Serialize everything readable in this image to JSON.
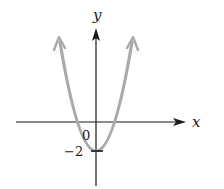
{
  "figure": {
    "x_axis_label": "x",
    "y_axis_label": "y",
    "origin_label": "0",
    "y_intercept_label": "−2",
    "curve_color": "#aaaaaa",
    "axis_color": "#1a1a1a"
  }
}
